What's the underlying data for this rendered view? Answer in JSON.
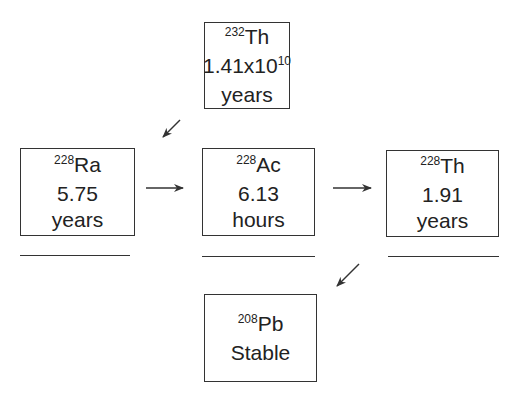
{
  "nodes": {
    "th232": {
      "mass": "232",
      "symbol": "Th",
      "halflife_base": "1.41x10",
      "halflife_exp": "10",
      "unit": "years"
    },
    "ra228": {
      "mass": "228",
      "symbol": "Ra",
      "halflife": "5.75",
      "unit": "years"
    },
    "ac228": {
      "mass": "228",
      "symbol": "Ac",
      "halflife": "6.13",
      "unit": "hours"
    },
    "th228": {
      "mass": "228",
      "symbol": "Th",
      "halflife": "1.91",
      "unit": "years"
    },
    "pb208": {
      "mass": "208",
      "symbol": "Pb",
      "halflife": "Stable"
    }
  },
  "edges": [
    {
      "from": "th232",
      "to": "ra228"
    },
    {
      "from": "ra228",
      "to": "ac228"
    },
    {
      "from": "ac228",
      "to": "th228"
    },
    {
      "from": "th228",
      "to": "pb208"
    }
  ],
  "colors": {
    "stroke": "#333333",
    "text": "#222222",
    "background": "#ffffff"
  }
}
